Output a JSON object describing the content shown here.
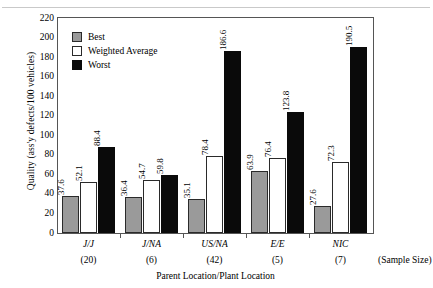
{
  "chart_data": {
    "type": "bar",
    "title": "",
    "xlabel": "Parent Location/Plant Location",
    "ylabel": "Quality (ass'y defects/100 vehicles)",
    "ylim": [
      0,
      220
    ],
    "ytick_step": 20,
    "yticks": [
      0,
      20,
      40,
      60,
      80,
      100,
      120,
      140,
      160,
      180,
      200,
      220
    ],
    "grid": false,
    "legend_position": "upper-left-inside",
    "categories": [
      "J/J",
      "J/NA",
      "US/NA",
      "E/E",
      "NIC"
    ],
    "sample_sizes": [
      "(20)",
      "(6)",
      "(42)",
      "(5)",
      "(7)"
    ],
    "sample_size_note": "(Sample Size)",
    "series": [
      {
        "name": "Best",
        "color": "#9a9a9a",
        "values": [
          37.6,
          36.4,
          35.1,
          63.9,
          27.6
        ]
      },
      {
        "name": "Weighted Average",
        "color": "#ffffff",
        "values": [
          52.1,
          54.7,
          78.4,
          76.4,
          72.3
        ]
      },
      {
        "name": "Worst",
        "color": "#0a0a0a",
        "values": [
          88.4,
          59.8,
          186.6,
          123.8,
          190.5
        ]
      }
    ],
    "value_labels": [
      [
        "37.6",
        "52.1",
        "88.4"
      ],
      [
        "36.4",
        "54.7",
        "59.8"
      ],
      [
        "35.1",
        "78.4",
        "186.6"
      ],
      [
        "63.9",
        "76.4",
        "123.8"
      ],
      [
        "27.6",
        "72.3",
        "190.5"
      ]
    ]
  }
}
